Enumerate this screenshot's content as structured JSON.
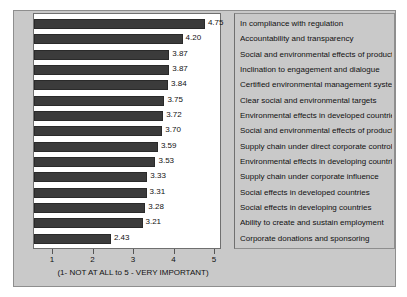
{
  "chart_data": {
    "type": "bar",
    "orientation": "horizontal",
    "title": "",
    "xlabel": "(1- NOT AT ALL to 5 - VERY IMPORTANT)",
    "ylabel": "",
    "xlim": [
      1,
      5
    ],
    "xticks": [
      1,
      2,
      3,
      4,
      5
    ],
    "xtick_labels": [
      "1",
      "2",
      "3",
      "4",
      "5"
    ],
    "grid": false,
    "legend": "none",
    "bar_color": "#3b3b3b",
    "plot_background": "#ffffff",
    "frame_background": "#c9c9c9",
    "categories": [
      "In compliance with regulation",
      "Accountability and transparency",
      "Social and environmental effects of production",
      "Inclination to engagement and dialogue",
      "Certified environmental management systems",
      "Clear social and environmental targets",
      "Environmental effects in developed countries",
      "Social and environmental effects of products",
      "Supply chain under direct corporate control",
      "Environmental effects in developing countries",
      "Supply chain under corporate influence",
      "Social effects in developed countries",
      "Social effects in developing countries",
      "Ability to create and sustain employment",
      "Corporate donations and sponsoring"
    ],
    "values": [
      4.75,
      4.2,
      3.87,
      3.87,
      3.84,
      3.75,
      3.72,
      3.7,
      3.59,
      3.53,
      3.33,
      3.31,
      3.28,
      3.21,
      2.43
    ],
    "value_labels": [
      "4.75",
      "4.20",
      "3.87",
      "3.87",
      "3.84",
      "3.75",
      "3.72",
      "3.70",
      "3.59",
      "3.53",
      "3.33",
      "3.31",
      "3.28",
      "3.21",
      "2.43"
    ]
  }
}
